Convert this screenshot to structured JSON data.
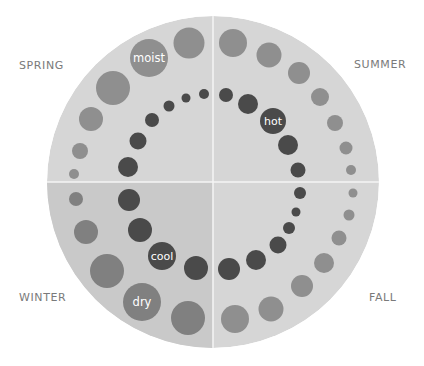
{
  "diagram": {
    "type": "seasonal-bubble-wheel",
    "wheel": {
      "cx": 213,
      "cy": 182,
      "r": 166
    },
    "colors": {
      "wheel_fill": "#d6d6d6",
      "winter_fill": "#c9c9c9",
      "divider": "#f4f4f4",
      "outer_bubble": "#8f8f8f",
      "outer_bubble_winter": "#808080",
      "inner_bubble": "#4a4a4a",
      "bubble_text": "#ffffff",
      "label_text": "#7a7a7a"
    },
    "season_labels": [
      {
        "id": "spring",
        "text": "SPRING"
      },
      {
        "id": "summer",
        "text": "SUMMER"
      },
      {
        "id": "winter",
        "text": "WINTER"
      },
      {
        "id": "fall",
        "text": "FALL"
      }
    ],
    "outer_ring": [
      {
        "season": "spring",
        "cx": 189,
        "cy": 43,
        "r": 15.5
      },
      {
        "season": "spring",
        "cx": 149,
        "cy": 58,
        "r": 19,
        "label": "moist"
      },
      {
        "season": "spring",
        "cx": 113,
        "cy": 88,
        "r": 17
      },
      {
        "season": "spring",
        "cx": 91,
        "cy": 119,
        "r": 12
      },
      {
        "season": "spring",
        "cx": 80,
        "cy": 151,
        "r": 8
      },
      {
        "season": "spring",
        "cx": 74,
        "cy": 174,
        "r": 5
      },
      {
        "season": "summer",
        "cx": 233,
        "cy": 43,
        "r": 14
      },
      {
        "season": "summer",
        "cx": 269,
        "cy": 55,
        "r": 12.5
      },
      {
        "season": "summer",
        "cx": 299,
        "cy": 73,
        "r": 11
      },
      {
        "season": "summer",
        "cx": 320,
        "cy": 97,
        "r": 9
      },
      {
        "season": "summer",
        "cx": 335,
        "cy": 123,
        "r": 8
      },
      {
        "season": "summer",
        "cx": 346,
        "cy": 148,
        "r": 6.5
      },
      {
        "season": "summer",
        "cx": 351,
        "cy": 170,
        "r": 5
      },
      {
        "season": "fall",
        "cx": 353,
        "cy": 193,
        "r": 4.5
      },
      {
        "season": "fall",
        "cx": 349,
        "cy": 215,
        "r": 5.5
      },
      {
        "season": "fall",
        "cx": 339,
        "cy": 238,
        "r": 7.5
      },
      {
        "season": "fall",
        "cx": 324,
        "cy": 263,
        "r": 10
      },
      {
        "season": "fall",
        "cx": 302,
        "cy": 286,
        "r": 11
      },
      {
        "season": "fall",
        "cx": 271,
        "cy": 309,
        "r": 12.5
      },
      {
        "season": "fall",
        "cx": 235,
        "cy": 319,
        "r": 14
      },
      {
        "season": "winter",
        "cx": 76,
        "cy": 199,
        "r": 7
      },
      {
        "season": "winter",
        "cx": 86,
        "cy": 232,
        "r": 12
      },
      {
        "season": "winter",
        "cx": 107,
        "cy": 271,
        "r": 17
      },
      {
        "season": "winter",
        "cx": 142,
        "cy": 302,
        "r": 19,
        "label": "dry"
      },
      {
        "season": "winter",
        "cx": 188,
        "cy": 318,
        "r": 17
      }
    ],
    "inner_ring": [
      {
        "season": "spring",
        "cx": 128,
        "cy": 167,
        "r": 10
      },
      {
        "season": "spring",
        "cx": 138,
        "cy": 141,
        "r": 8.5
      },
      {
        "season": "spring",
        "cx": 152,
        "cy": 120,
        "r": 7
      },
      {
        "season": "spring",
        "cx": 169,
        "cy": 106,
        "r": 5.5
      },
      {
        "season": "spring",
        "cx": 186,
        "cy": 98,
        "r": 4.5
      },
      {
        "season": "spring",
        "cx": 204,
        "cy": 94,
        "r": 5
      },
      {
        "season": "summer",
        "cx": 226,
        "cy": 95,
        "r": 7
      },
      {
        "season": "summer",
        "cx": 248,
        "cy": 104,
        "r": 10
      },
      {
        "season": "summer",
        "cx": 273,
        "cy": 121,
        "r": 13,
        "label": "hot"
      },
      {
        "season": "summer",
        "cx": 288,
        "cy": 145,
        "r": 10
      },
      {
        "season": "summer",
        "cx": 298,
        "cy": 170,
        "r": 7.5
      },
      {
        "season": "fall",
        "cx": 300,
        "cy": 193,
        "r": 6
      },
      {
        "season": "fall",
        "cx": 296,
        "cy": 212,
        "r": 4.5
      },
      {
        "season": "fall",
        "cx": 289,
        "cy": 228,
        "r": 6
      },
      {
        "season": "fall",
        "cx": 278,
        "cy": 245,
        "r": 8.5
      },
      {
        "season": "fall",
        "cx": 256,
        "cy": 260,
        "r": 10
      },
      {
        "season": "fall",
        "cx": 229,
        "cy": 269,
        "r": 11
      },
      {
        "season": "winter",
        "cx": 196,
        "cy": 268,
        "r": 12
      },
      {
        "season": "winter",
        "cx": 162,
        "cy": 256,
        "r": 14,
        "label": "cool"
      },
      {
        "season": "winter",
        "cx": 140,
        "cy": 230,
        "r": 12
      },
      {
        "season": "winter",
        "cx": 129,
        "cy": 200,
        "r": 11
      }
    ]
  }
}
